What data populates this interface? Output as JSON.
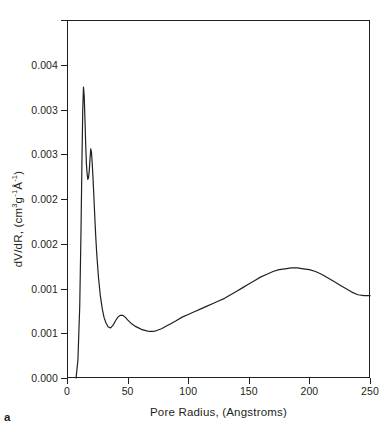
{
  "panel": {
    "letter": "a"
  },
  "chart_data": {
    "type": "line",
    "title": "",
    "subtitle": "",
    "xlabel": "Pore Radius, (Angstroms)",
    "ylabel": "dV/dR, (cm3g-1A-1)",
    "ylabel_parts": {
      "main": "dV/dR, (cm",
      "sup1": "3",
      "mid": "g",
      "sup2": "-1",
      "angstrom": "Å",
      "sup3": "-1",
      "close": ")"
    },
    "grid": false,
    "legend": false,
    "xlim": [
      0,
      250
    ],
    "ylim": [
      0.0,
      0.004
    ],
    "xticks": [
      0,
      50,
      100,
      150,
      200,
      250
    ],
    "xticklabels": [
      "0",
      "50",
      "100",
      "150",
      "200",
      "250"
    ],
    "yticks": [
      0.0,
      0.0005,
      0.001,
      0.0015,
      0.002,
      0.0025,
      0.003,
      0.0035,
      0.004
    ],
    "yticklabels_shown": [
      "0.000",
      "0.001",
      "0.001",
      "0.002",
      "0.002",
      "0.003",
      "0.003",
      "0.004"
    ],
    "ytick_values_shown": [
      0.0,
      0.0005,
      0.001,
      0.0015,
      0.002,
      0.0025,
      0.003,
      0.0035,
      0.004
    ],
    "series": [
      {
        "name": "dV/dR",
        "color": "#231f20",
        "x": [
          7.5,
          9.0,
          10.5,
          11.5,
          12.3,
          13.0,
          13.6,
          14.2,
          14.8,
          15.4,
          16.0,
          16.6,
          17.2,
          17.8,
          18.4,
          19.0,
          19.6,
          20.2,
          20.8,
          21.4,
          22.0,
          22.6,
          23.2,
          23.8,
          24.4,
          25.0,
          26.0,
          27.5,
          29.0,
          30.5,
          32.0,
          34.0,
          36.0,
          38.0,
          40.0,
          42.0,
          44.0,
          46.0,
          48.0,
          50.0,
          53.0,
          56.0,
          59.0,
          62.0,
          65.0,
          68.0,
          71.0,
          74.0,
          78.0,
          82.0,
          86.0,
          90.0,
          95.0,
          100.0,
          105.0,
          110.0,
          115.0,
          120.0,
          125.0,
          130.0,
          135.0,
          140.0,
          145.0,
          150.0,
          155.0,
          160.0,
          165.0,
          170.0,
          175.0,
          180.0,
          185.0,
          190.0,
          195.0,
          200.0,
          205.0,
          210.0,
          215.0,
          220.0,
          225.0,
          230.0,
          235.0,
          240.0,
          245.0,
          250.0
        ],
        "y": [
          0.0,
          0.0002,
          0.0008,
          0.0016,
          0.0024,
          0.003,
          0.00325,
          0.00315,
          0.0029,
          0.00262,
          0.0024,
          0.00228,
          0.00222,
          0.00224,
          0.00232,
          0.00245,
          0.00256,
          0.00252,
          0.0024,
          0.00225,
          0.00208,
          0.0019,
          0.00172,
          0.00156,
          0.00142,
          0.0013,
          0.00112,
          0.00092,
          0.00078,
          0.00068,
          0.00062,
          0.00057,
          0.00056,
          0.00059,
          0.00064,
          0.00068,
          0.0007,
          0.0007,
          0.00068,
          0.00065,
          0.00061,
          0.00058,
          0.00056,
          0.00054,
          0.00053,
          0.00052,
          0.00052,
          0.00053,
          0.00055,
          0.00058,
          0.00061,
          0.00064,
          0.00068,
          0.00071,
          0.00074,
          0.00077,
          0.0008,
          0.00083,
          0.00086,
          0.00089,
          0.00093,
          0.00097,
          0.00101,
          0.00105,
          0.00109,
          0.00113,
          0.00116,
          0.00119,
          0.00121,
          0.00122,
          0.00123,
          0.00123,
          0.00122,
          0.00121,
          0.00119,
          0.00116,
          0.00112,
          0.00108,
          0.00104,
          0.001,
          0.00096,
          0.00093,
          0.00092,
          0.00092
        ]
      }
    ]
  }
}
